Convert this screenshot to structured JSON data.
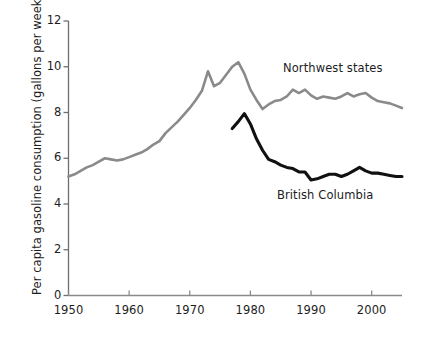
{
  "chart_data": {
    "type": "line",
    "title": "",
    "xlabel": "",
    "ylabel": "Per capita gasoline consumption (gallons per week)",
    "xlim": [
      1950,
      2005
    ],
    "ylim": [
      0,
      12
    ],
    "xticks": [
      1950,
      1960,
      1970,
      1980,
      1990,
      2000
    ],
    "yticks": [
      0,
      2,
      4,
      6,
      8,
      10,
      12
    ],
    "xtick_labels": [
      "1950",
      "1960",
      "1970",
      "1980",
      "1990",
      "2000"
    ],
    "ytick_labels": [
      "0",
      "2",
      "4",
      "6",
      "8",
      "10",
      "12"
    ],
    "grid": false,
    "legend_position": "inline-annotations",
    "series": [
      {
        "name": "Northwest states",
        "color": "#8a8a8a",
        "x": [
          1950,
          1951,
          1952,
          1953,
          1954,
          1955,
          1956,
          1957,
          1958,
          1959,
          1960,
          1961,
          1962,
          1963,
          1964,
          1965,
          1966,
          1967,
          1968,
          1969,
          1970,
          1971,
          1972,
          1973,
          1974,
          1975,
          1976,
          1977,
          1978,
          1979,
          1980,
          1981,
          1982,
          1983,
          1984,
          1985,
          1986,
          1987,
          1988,
          1989,
          1990,
          1991,
          1992,
          1993,
          1994,
          1995,
          1996,
          1997,
          1998,
          1999,
          2000,
          2001,
          2002,
          2003,
          2004,
          2005
        ],
        "values": [
          5.2,
          5.3,
          5.45,
          5.6,
          5.7,
          5.85,
          6.0,
          5.95,
          5.9,
          5.95,
          6.05,
          6.15,
          6.25,
          6.4,
          6.6,
          6.75,
          7.1,
          7.35,
          7.6,
          7.9,
          8.2,
          8.55,
          8.95,
          9.8,
          9.15,
          9.3,
          9.65,
          10.0,
          10.2,
          9.7,
          9.0,
          8.55,
          8.15,
          8.35,
          8.5,
          8.55,
          8.7,
          9.0,
          8.85,
          9.0,
          8.75,
          8.6,
          8.7,
          8.65,
          8.6,
          8.7,
          8.85,
          8.7,
          8.8,
          8.85,
          8.65,
          8.5,
          8.45,
          8.4,
          8.3,
          8.2
        ]
      },
      {
        "name": "British Columbia",
        "color": "#111111",
        "x": [
          1977,
          1978,
          1979,
          1980,
          1981,
          1982,
          1983,
          1984,
          1985,
          1986,
          1987,
          1988,
          1989,
          1990,
          1991,
          1992,
          1993,
          1994,
          1995,
          1996,
          1997,
          1998,
          1999,
          2000,
          2001,
          2002,
          2003,
          2004,
          2005
        ],
        "values": [
          7.3,
          7.6,
          7.95,
          7.5,
          6.85,
          6.35,
          5.95,
          5.85,
          5.7,
          5.6,
          5.55,
          5.4,
          5.4,
          5.05,
          5.1,
          5.2,
          5.3,
          5.3,
          5.2,
          5.3,
          5.45,
          5.6,
          5.45,
          5.35,
          5.35,
          5.3,
          5.25,
          5.2,
          5.2
        ]
      }
    ],
    "annotations": [
      {
        "text": "Northwest states",
        "series": "Northwest states"
      },
      {
        "text": "British Columbia",
        "series": "British Columbia"
      }
    ]
  },
  "axis": {
    "y_title": "Per capita gasoline consumption (gallons per week)",
    "y_labels": [
      "12",
      "10",
      "8",
      "6",
      "4",
      "2",
      "0"
    ],
    "x_labels": [
      "1950",
      "1960",
      "1970",
      "1980",
      "1990",
      "2000"
    ]
  },
  "labels": {
    "northwest": "Northwest states",
    "british_columbia": "British Columbia"
  },
  "colors": {
    "northwest_line": "#8a8a8a",
    "british_columbia_line": "#111111",
    "axis": "#6e6e6e",
    "text": "#1d1d1d",
    "background": "#ffffff"
  }
}
